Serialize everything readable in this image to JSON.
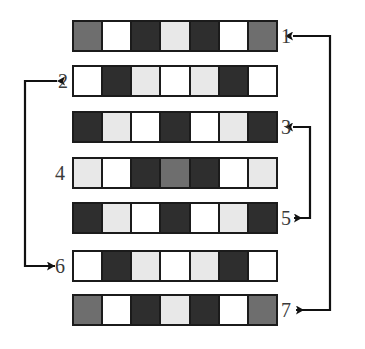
{
  "diagram": {
    "palette": {
      "dark": "#2e2e2e",
      "mid": "#6e6e6e",
      "light": "#e8e8e8",
      "white": "#ffffff",
      "outline": "#1b1b1b",
      "label": "#3a3a3a",
      "connector": "#111111"
    },
    "rows": [
      {
        "label": "1",
        "label_side": "right",
        "cells": [
          "mid",
          "white",
          "dark",
          "light",
          "dark",
          "white",
          "mid"
        ]
      },
      {
        "label": "2",
        "label_side": "left",
        "cells": [
          "white",
          "dark",
          "light",
          "white",
          "light",
          "dark",
          "white"
        ]
      },
      {
        "label": "3",
        "label_side": "right",
        "cells": [
          "dark",
          "light",
          "white",
          "dark",
          "white",
          "light",
          "dark"
        ]
      },
      {
        "label": "4",
        "label_side": "left",
        "cells": [
          "light",
          "white",
          "dark",
          "mid",
          "dark",
          "white",
          "light"
        ]
      },
      {
        "label": "5",
        "label_side": "right",
        "cells": [
          "dark",
          "light",
          "white",
          "dark",
          "white",
          "light",
          "dark"
        ]
      },
      {
        "label": "6",
        "label_side": "left",
        "cells": [
          "white",
          "dark",
          "light",
          "white",
          "light",
          "dark",
          "white"
        ]
      },
      {
        "label": "7",
        "label_side": "right",
        "cells": [
          "mid",
          "white",
          "dark",
          "light",
          "dark",
          "white",
          "mid"
        ]
      }
    ],
    "connectors": [
      {
        "name": "connector-1-7",
        "from": "1",
        "to": "7",
        "side": "right",
        "arrowheads": "both"
      },
      {
        "name": "connector-3-5",
        "from": "3",
        "to": "5",
        "side": "right",
        "arrowheads": "both"
      },
      {
        "name": "connector-2-6",
        "from": "2",
        "to": "6",
        "side": "left",
        "arrowheads": "both"
      }
    ]
  }
}
